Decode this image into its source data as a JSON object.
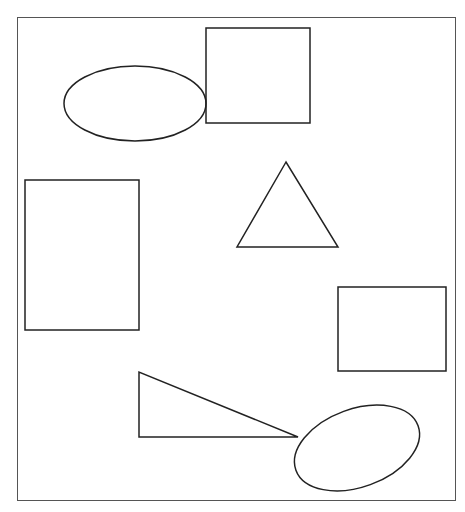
{
  "canvas": {
    "width": 465,
    "height": 512,
    "background": "#ffffff"
  },
  "frame": {
    "x": 17,
    "y": 17,
    "width": 438,
    "height": 483,
    "stroke": "#555555",
    "stroke_width": 1
  },
  "stroke_color": "#222222",
  "shapes": [
    {
      "type": "ellipse",
      "name": "ellipse-top-left",
      "cx": 135,
      "cy": 103.5,
      "rx": 71,
      "ry": 37.5,
      "rotate": 0
    },
    {
      "type": "rect",
      "name": "square-top",
      "x": 206,
      "y": 28,
      "width": 104,
      "height": 95
    },
    {
      "type": "polygon",
      "name": "equilateral-triangle",
      "points": "286,162 237,247 338,247"
    },
    {
      "type": "rect",
      "name": "tall-rectangle-left",
      "x": 25,
      "y": 180,
      "width": 114,
      "height": 150
    },
    {
      "type": "rect",
      "name": "rectangle-right",
      "x": 338,
      "y": 287,
      "width": 108,
      "height": 84
    },
    {
      "type": "polygon",
      "name": "right-triangle",
      "points": "139,372 139,437 298,437"
    },
    {
      "type": "ellipse",
      "name": "tilted-ellipse-bottom-right",
      "cx": 357,
      "cy": 448,
      "rx": 65,
      "ry": 39,
      "rotate": -20
    }
  ]
}
